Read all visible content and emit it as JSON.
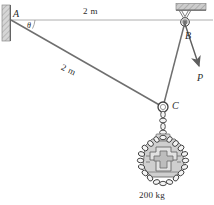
{
  "figure": {
    "labels": {
      "point_a": "A",
      "point_b": "B",
      "point_c": "C",
      "force_p": "P",
      "angle_theta": "θ",
      "top_dimension": "2 m",
      "diagonal_dimension": "2 m",
      "mass_label": "200 kg"
    },
    "colors": {
      "line": "#6f6f6f",
      "ink": "#2b2b2b",
      "hatch_fill": "#cfcfcf",
      "hatch_stroke": "#8a8a8a",
      "chain": "#f0f0f0",
      "chain_stroke": "#4a4a4a",
      "load_fill": "#c9c9c9",
      "load_stroke": "#6a6a6a"
    },
    "geometry": {
      "point_a": [
        11,
        20
      ],
      "point_b": [
        185,
        22
      ],
      "point_c": [
        163,
        107
      ],
      "force_p_tip": [
        200,
        68
      ],
      "top_span_m": 2,
      "cable_ac_m": 2,
      "load_mass_kg": 200
    },
    "parts": {
      "wall_support": "wall-hatch",
      "ceiling_support": "ceiling-hatch",
      "pulley": "pulley-wheel",
      "ring": "ring-connector",
      "chain": "chain-sling",
      "load": "engine-block-load"
    }
  }
}
